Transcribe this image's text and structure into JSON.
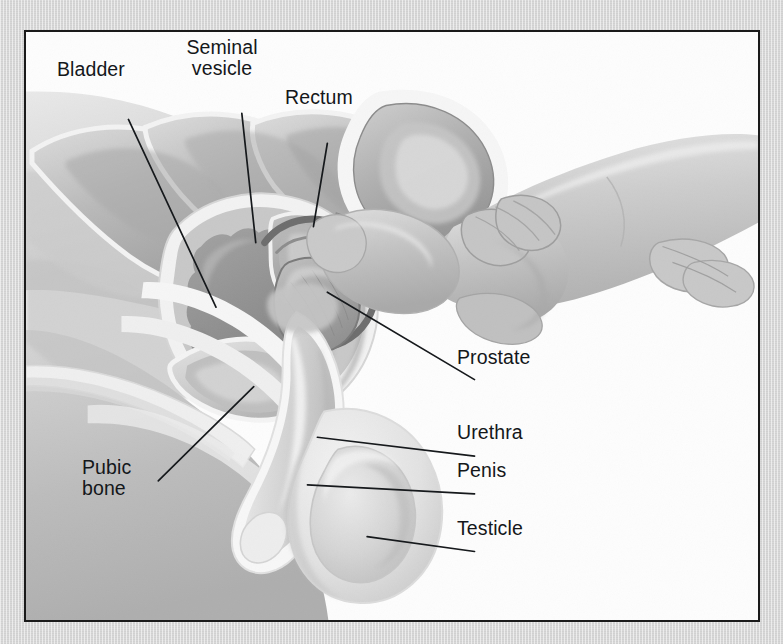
{
  "figure": {
    "type": "medical-illustration",
    "frame_color": "#1a1a1a",
    "mat_color": "#d8d8d8",
    "canvas_color": "#fdfdfd",
    "label_color": "#14171a",
    "leader_line_color": "#16191c"
  },
  "labels": [
    {
      "id": "bladder",
      "text": "Bladder",
      "x": 55,
      "y": 57,
      "align": "left",
      "leader": {
        "x1": 103,
        "y1": 88,
        "x2": 191,
        "y2": 277
      }
    },
    {
      "id": "seminal-vesicle",
      "text": "Seminal\nvesicle",
      "x": 176,
      "y": 35,
      "align": "center",
      "leader": {
        "x1": 217,
        "y1": 82,
        "x2": 231,
        "y2": 212
      }
    },
    {
      "id": "rectum",
      "text": "Rectum",
      "x": 283,
      "y": 85,
      "align": "left",
      "leader": {
        "x1": 303,
        "y1": 112,
        "x2": 289,
        "y2": 196
      }
    },
    {
      "id": "prostate",
      "text": "Prostate",
      "x": 455,
      "y": 345,
      "align": "left",
      "leader": {
        "x1": 451,
        "y1": 350,
        "x2": 303,
        "y2": 262
      }
    },
    {
      "id": "urethra",
      "text": "Urethra",
      "x": 455,
      "y": 420,
      "align": "left",
      "leader": {
        "x1": 451,
        "y1": 427,
        "x2": 293,
        "y2": 408
      }
    },
    {
      "id": "penis",
      "text": "Penis",
      "x": 455,
      "y": 458,
      "align": "left",
      "leader": {
        "x1": 451,
        "y1": 465,
        "x2": 283,
        "y2": 456
      }
    },
    {
      "id": "testicle",
      "text": "Testicle",
      "x": 455,
      "y": 516,
      "align": "left",
      "leader": {
        "x1": 451,
        "y1": 523,
        "x2": 343,
        "y2": 508
      }
    },
    {
      "id": "pubic-bone",
      "text": "Pubic\nbone",
      "x": 80,
      "y": 455,
      "align": "left",
      "leader": {
        "x1": 133,
        "y1": 452,
        "x2": 229,
        "y2": 357
      }
    }
  ],
  "anatomy_parts": [
    "Bladder",
    "Seminal vesicle",
    "Rectum",
    "Prostate",
    "Urethra",
    "Penis",
    "Testicle",
    "Pubic bone",
    "Examining hand and index finger"
  ],
  "palette": {
    "skin_light": "#e8e8e8",
    "skin_mid": "#c9c9c9",
    "skin_dark": "#a8a8a8",
    "organ_light": "#dcdcdc",
    "organ_mid": "#b4b4b4",
    "organ_dark": "#8d8d8d",
    "bladder_fill": "#8e8e8e",
    "outline": "#6e6e6e",
    "highlight": "#f4f4f4"
  }
}
